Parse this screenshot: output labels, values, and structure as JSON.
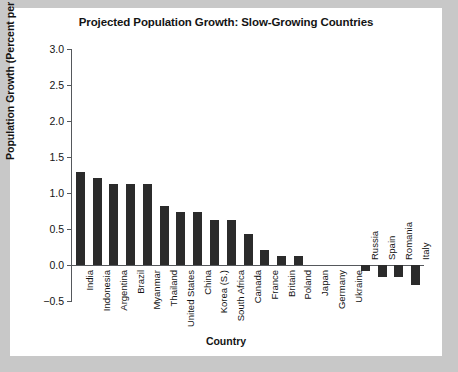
{
  "chart_data": {
    "type": "bar",
    "title": "Projected Population Growth: Slow-Growing Countries",
    "xlabel": "Country",
    "ylabel": "Population Growth (Percent per Year)",
    "ylim": [
      -0.5,
      3.0
    ],
    "yticks": [
      "3.0",
      "2.5",
      "2.0",
      "1.5",
      "1.0",
      "0.5",
      "0.0",
      "−0.5"
    ],
    "ytick_values": [
      3.0,
      2.5,
      2.0,
      1.5,
      1.0,
      0.5,
      0.0,
      -0.5
    ],
    "grid": false,
    "legend": "none",
    "bar_color": "#2b2b2b",
    "categories": [
      "India",
      "Indonesia",
      "Argentina",
      "Brazil",
      "Myanmar",
      "Thailand",
      "United States",
      "China",
      "Korea (S.)",
      "South Africa",
      "Canada",
      "France",
      "Britain",
      "Poland",
      "Japan",
      "Germany",
      "Ukraine",
      "Russia",
      "Spain",
      "Romania",
      "Italy"
    ],
    "values": [
      1.29,
      1.21,
      1.12,
      1.12,
      1.12,
      0.82,
      0.73,
      0.73,
      0.62,
      0.62,
      0.43,
      0.21,
      0.12,
      0.12,
      0.0,
      0.0,
      0.0,
      -0.08,
      -0.17,
      -0.17,
      -0.28
    ]
  }
}
